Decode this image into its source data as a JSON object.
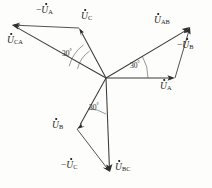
{
  "diagram": {
    "type": "phasor-diagram",
    "origin": {
      "x": 106,
      "y": 78
    },
    "colors": {
      "background": "#fdfdfb",
      "vector_stroke": "#3a3a3a",
      "construction_stroke": "#4a4a4a",
      "arc_stroke": "#6a6a6a",
      "text": "#1d1d1d"
    },
    "angle_labels": [
      {
        "name": "angle-upper-left",
        "value": "30",
        "unit": "°",
        "x": 64,
        "y": 50
      },
      {
        "name": "angle-right",
        "value": "30",
        "unit": "°",
        "x": 131,
        "y": 62
      },
      {
        "name": "angle-lower",
        "value": "30",
        "unit": "°",
        "x": 90,
        "y": 104
      }
    ],
    "vectors": [
      {
        "name": "U-A",
        "label_neg": "",
        "symbol": "U",
        "subscript": "A",
        "angle_deg": 0,
        "length": 69,
        "tip": {
          "x": 175,
          "y": 78
        },
        "label_pos": {
          "x": 160,
          "y": 82
        }
      },
      {
        "name": "U-B",
        "label_neg": "",
        "symbol": "U",
        "subscript": "B",
        "angle_deg": 240,
        "length": 59,
        "tip": {
          "x": 77,
          "y": 129
        },
        "label_pos": {
          "x": 54,
          "y": 122
        }
      },
      {
        "name": "U-C",
        "label_neg": "",
        "symbol": "U",
        "subscript": "C",
        "angle_deg": 120,
        "length": 58,
        "tip": {
          "x": 79,
          "y": 28
        },
        "label_pos": {
          "x": 82,
          "y": 12
        }
      },
      {
        "name": "U-AB",
        "label_neg": "",
        "symbol": "U",
        "subscript": "AB",
        "angle_deg": 30,
        "length": 97,
        "tip": {
          "x": 190,
          "y": 27
        },
        "label_pos": {
          "x": 156,
          "y": 16
        }
      },
      {
        "name": "U-BC",
        "label_neg": "",
        "symbol": "U",
        "subscript": "BC",
        "angle_deg": 270,
        "length": 94,
        "tip": {
          "x": 110,
          "y": 172
        },
        "label_pos": {
          "x": 115,
          "y": 165
        }
      },
      {
        "name": "U-CA",
        "label_neg": "",
        "symbol": "U",
        "subscript": "CA",
        "angle_deg": 155,
        "length": 101,
        "tip": {
          "x": 12,
          "y": 25
        },
        "label_pos": {
          "x": 9,
          "y": 36
        }
      }
    ],
    "construction_vectors": [
      {
        "name": "minus-U-A",
        "label_neg": "−",
        "symbol": "U",
        "subscript": "A",
        "from": {
          "x": 79,
          "y": 28
        },
        "to": {
          "x": 12,
          "y": 25
        },
        "label_pos": {
          "x": 38,
          "y": 7
        }
      },
      {
        "name": "minus-U-B",
        "label_neg": "−",
        "symbol": "U",
        "subscript": "B",
        "from": {
          "x": 175,
          "y": 78
        },
        "to": {
          "x": 190,
          "y": 27
        },
        "label_pos": {
          "x": 178,
          "y": 41
        }
      },
      {
        "name": "minus-U-C",
        "label_neg": "−",
        "symbol": "U",
        "subscript": "C",
        "from": {
          "x": 77,
          "y": 129
        },
        "to": {
          "x": 110,
          "y": 172
        },
        "label_pos": {
          "x": 63,
          "y": 160
        }
      }
    ]
  }
}
